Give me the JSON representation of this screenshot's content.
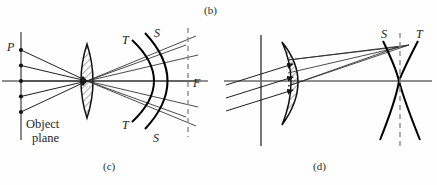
{
  "figure": {
    "background_color": "#fefefe",
    "ink_color": "#262626",
    "accent_color": "#000000",
    "width": 437,
    "height": 185,
    "top_caption": "(b)",
    "panels": [
      {
        "id": "c",
        "caption": "(c)",
        "caption_x": 103,
        "caption_y": 160,
        "lens_type": "biconvex",
        "object_plane_label_line1": "Object",
        "object_plane_label_line2": "plane",
        "point_label": "P",
        "focus_label": "F",
        "surface_labels": [
          {
            "text": "T",
            "x": 122,
            "y": 33
          },
          {
            "text": "S",
            "x": 154,
            "y": 26
          },
          {
            "text": "T",
            "x": 122,
            "y": 118
          },
          {
            "text": "S",
            "x": 153,
            "y": 131
          }
        ],
        "ray_count": 5,
        "object_point_count": 5
      },
      {
        "id": "d",
        "caption": "(d)",
        "caption_x": 313,
        "caption_y": 160,
        "lens_type": "meniscus",
        "surface_labels": [
          {
            "text": "S",
            "x": 381,
            "y": 27
          },
          {
            "text": "T",
            "x": 416,
            "y": 27
          }
        ],
        "ray_count": 3
      }
    ]
  }
}
